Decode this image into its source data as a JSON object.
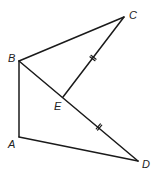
{
  "diagram": {
    "type": "geometry-figure",
    "points": {
      "A": {
        "label": "A",
        "x": 19,
        "y": 137,
        "lx": 8,
        "ly": 148
      },
      "B": {
        "label": "B",
        "x": 19,
        "y": 61,
        "lx": 8,
        "ly": 62
      },
      "C": {
        "label": "C",
        "x": 124,
        "y": 17,
        "lx": 129,
        "ly": 19
      },
      "D": {
        "label": "D",
        "x": 138,
        "y": 161,
        "lx": 142,
        "ly": 168
      },
      "E": {
        "label": "E",
        "x": 63,
        "y": 97,
        "lx": 54,
        "ly": 110
      }
    },
    "segments": [
      {
        "from": "B",
        "to": "C"
      },
      {
        "from": "B",
        "to": "A"
      },
      {
        "from": "A",
        "to": "D"
      },
      {
        "from": "B",
        "to": "D"
      },
      {
        "from": "E",
        "to": "C"
      }
    ],
    "congruence_marks": [
      {
        "segment": "EC",
        "ticks": 2,
        "x": 93,
        "y": 58
      },
      {
        "segment": "ED",
        "ticks": 2,
        "x": 99,
        "y": 127
      }
    ],
    "colors": {
      "stroke": "#1a1a1a",
      "label": "#222222",
      "background": "#ffffff"
    }
  }
}
